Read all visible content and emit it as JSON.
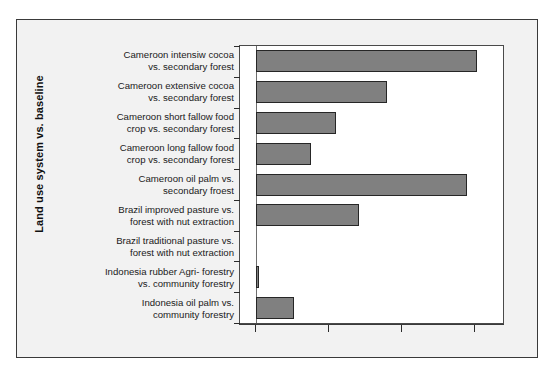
{
  "figure": {
    "background_color": "#f2f2f2",
    "frame_color": "#3a3a3a",
    "plot_background": "#ffffff"
  },
  "chart_data": {
    "type": "bar",
    "orientation": "horizontal",
    "title": "",
    "subtitle": "",
    "xlabel": "",
    "ylabel": "Land use system vs. baseline",
    "grid": false,
    "legend": null,
    "bar_color": "#808080",
    "bar_edge_color": "#262626",
    "xlim": [
      0,
      265
    ],
    "xticks": [
      0,
      73,
      146,
      219
    ],
    "xticklabels": [
      "",
      "",
      "",
      ""
    ],
    "categories": [
      "Cameroon intensiw cocoa vs. secondary forest",
      "Cameroon extensive cocoa vs. secondary forest",
      "Cameroon short fallow food crop vs. secondary forest",
      "Cameroon long fallow food crop vs. secondary forest",
      "Cameroon oil palm vs. secondary froest",
      "Brazil improved pasture vs. forest with nut extraction",
      "Brazil traditional pasture vs. forest with nut extraction",
      "Indonesia rubber Agri- forestry vs. community forestry",
      "Indonesia oil palm vs. community forestry"
    ],
    "values": [
      221,
      131,
      80,
      55,
      211,
      103,
      0,
      3,
      38
    ],
    "annotations": []
  },
  "axis": {
    "y_title": "Land use system vs. baseline",
    "category_lines": [
      [
        "Cameroon intensiw cocoa",
        "vs. secondary forest"
      ],
      [
        "Cameroon extensive cocoa",
        "vs. secondary forest"
      ],
      [
        "Cameroon short fallow food",
        "crop vs. secondary forest"
      ],
      [
        "Cameroon long fallow food",
        "crop vs. secondary forest"
      ],
      [
        "Cameroon oil palm vs.",
        "secondary froest"
      ],
      [
        "Brazil improved pasture vs.",
        "forest with nut extraction"
      ],
      [
        "Brazil traditional pasture vs.",
        "forest with nut extraction"
      ],
      [
        "Indonesia rubber Agri- forestry",
        "vs. community forestry"
      ],
      [
        "Indonesia oil palm vs.",
        "community forestry"
      ]
    ]
  }
}
